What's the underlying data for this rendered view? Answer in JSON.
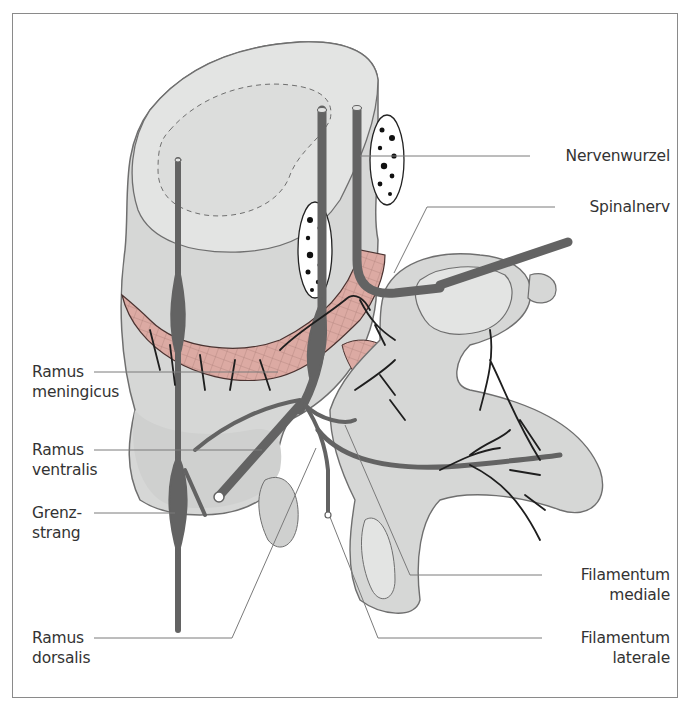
{
  "figure": {
    "frame_color": "#8a8a8a",
    "colors": {
      "bone_fill": "#d6d7d6",
      "bone_shade": "#bfc0bf",
      "bone_light": "#e3e4e3",
      "bone_outline": "#6f6f6f",
      "nerve": "#636363",
      "vessel": "#1e1e1e",
      "membrane_pink": "#dcaaa3",
      "leader_line": "#7a7a7a",
      "label_text": "#333333"
    }
  },
  "labels": {
    "left": [
      {
        "id": "ramus-meningicus",
        "line1": "Ramus",
        "line2": "meningicus"
      },
      {
        "id": "ramus-ventralis",
        "line1": "Ramus",
        "line2": "ventralis"
      },
      {
        "id": "grenzstrang",
        "line1": "Grenz-",
        "line2": "strang"
      },
      {
        "id": "ramus-dorsalis",
        "line1": "Ramus",
        "line2": "dorsalis"
      }
    ],
    "right": [
      {
        "id": "nervenwurzel",
        "line1": "Nervenwurzel"
      },
      {
        "id": "spinalnerv",
        "line1": "Spinalnerv"
      },
      {
        "id": "filamentum-mediale",
        "line1": "Filamentum",
        "line2": "mediale"
      },
      {
        "id": "filamentum-laterale",
        "line1": "Filamentum",
        "line2": "laterale"
      }
    ]
  }
}
